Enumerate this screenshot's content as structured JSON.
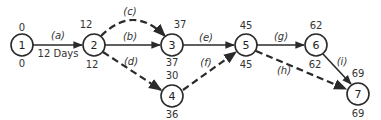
{
  "diagram": {
    "type": "network",
    "nodes": [
      {
        "id": "1",
        "label": "1",
        "x": 22,
        "y": 45,
        "early": "0",
        "late": "0"
      },
      {
        "id": "2",
        "label": "2",
        "x": 94,
        "y": 45,
        "early": "12",
        "late": "12"
      },
      {
        "id": "3",
        "label": "3",
        "x": 172,
        "y": 45,
        "early": "37",
        "late": "37"
      },
      {
        "id": "4",
        "label": "4",
        "x": 172,
        "y": 96,
        "early": "30",
        "late": "36"
      },
      {
        "id": "5",
        "label": "5",
        "x": 246,
        "y": 45,
        "early": "45",
        "late": "45"
      },
      {
        "id": "6",
        "label": "6",
        "x": 316,
        "y": 45,
        "early": "62",
        "late": "62"
      },
      {
        "id": "7",
        "label": "7",
        "x": 358,
        "y": 94,
        "early": "69",
        "late": "69"
      }
    ],
    "edges": [
      {
        "id": "a",
        "label": "(a)",
        "from": "1",
        "to": "2",
        "style": "solid",
        "duration_label": "12 Days"
      },
      {
        "id": "b",
        "label": "(b)",
        "from": "2",
        "to": "3",
        "style": "solid"
      },
      {
        "id": "c",
        "label": "(c)",
        "from": "2",
        "to": "3",
        "style": "dashed",
        "curved": true
      },
      {
        "id": "d",
        "label": "(d)",
        "from": "2",
        "to": "4",
        "style": "dashed"
      },
      {
        "id": "e",
        "label": "(e)",
        "from": "3",
        "to": "5",
        "style": "solid"
      },
      {
        "id": "f",
        "label": "(f)",
        "from": "4",
        "to": "5",
        "style": "dashed"
      },
      {
        "id": "g",
        "label": "(g)",
        "from": "5",
        "to": "6",
        "style": "solid"
      },
      {
        "id": "h",
        "label": "(h)",
        "from": "5",
        "to": "7",
        "style": "dashed"
      },
      {
        "id": "i",
        "label": "(i)",
        "from": "6",
        "to": "7",
        "style": "solid"
      }
    ]
  },
  "colors": {
    "stroke": "#2a2a2a",
    "text": "#222222",
    "background": "#ffffff"
  }
}
